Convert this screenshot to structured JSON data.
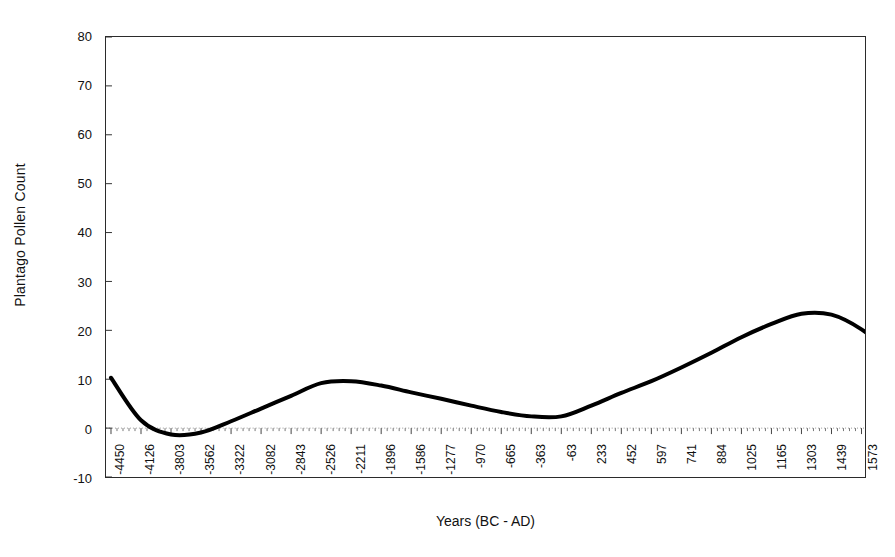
{
  "chart_data": {
    "type": "line",
    "title": "",
    "xlabel": "Years (BC - AD)",
    "ylabel": "Plantago Pollen Count",
    "ylim": [
      -10,
      80
    ],
    "yticks": [
      -10,
      0,
      10,
      20,
      30,
      40,
      50,
      60,
      70,
      80
    ],
    "ytick_labels": [
      "-10",
      "0",
      "10",
      "20",
      "30",
      "40",
      "50",
      "60",
      "70",
      "80"
    ],
    "grid": false,
    "zero_line": true,
    "legend": "none",
    "line_color": "#000000",
    "line_width": 4,
    "categories": [
      "-4450",
      "-4126",
      "-3803",
      "-3562",
      "-3322",
      "-3082",
      "-2843",
      "-2526",
      "-2211",
      "-1896",
      "-1586",
      "-1277",
      "-970",
      "-665",
      "-363",
      "-63",
      "233",
      "452",
      "597",
      "741",
      "884",
      "1025",
      "1165",
      "1303",
      "1439",
      "1573",
      "1703",
      "1829",
      "1948"
    ],
    "values": [
      10.3,
      1.6,
      -1.3,
      -0.9,
      1.4,
      4.0,
      6.6,
      9.2,
      9.6,
      8.7,
      7.3,
      6.0,
      4.6,
      3.3,
      2.4,
      2.4,
      4.6,
      7.2,
      9.6,
      12.4,
      15.4,
      18.6,
      21.3,
      23.4,
      23.2,
      20.2,
      15.3,
      10.2,
      4.4
    ],
    "series": [
      {
        "name": "Plantago Pollen Count",
        "values": [
          10.3,
          1.6,
          -1.3,
          -0.9,
          1.4,
          4.0,
          6.6,
          9.2,
          9.6,
          8.7,
          7.3,
          6.0,
          4.6,
          3.3,
          2.4,
          2.4,
          4.6,
          7.2,
          9.6,
          12.4,
          15.4,
          18.6,
          21.3,
          23.4,
          23.2,
          20.2,
          15.3,
          10.2,
          4.4
        ]
      }
    ],
    "annotations": []
  },
  "axes": {
    "y_title": "Plantago Pollen Count",
    "x_title": "Years (BC - AD)"
  }
}
